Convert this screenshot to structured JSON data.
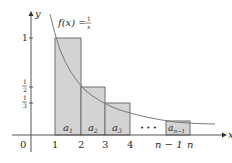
{
  "figure": {
    "function_label": "f(x) =",
    "function_numerator": "1",
    "function_denominator": "x",
    "axes": {
      "x_label": "x",
      "y_label": "y",
      "origin_label": "0"
    },
    "x_ticks": [
      "1",
      "2",
      "3",
      "4",
      "n − 1",
      "n"
    ],
    "y_ticks": [
      {
        "num": "1",
        "den": ""
      },
      {
        "num": "1",
        "den": "2"
      },
      {
        "num": "1",
        "den": "3"
      }
    ],
    "rectangles": [
      {
        "label": "a",
        "sub": "1",
        "x0": 1,
        "x1": 2,
        "height": 1
      },
      {
        "label": "a",
        "sub": "2",
        "x0": 2,
        "x1": 3,
        "height": 0.5
      },
      {
        "label": "a",
        "sub": "3",
        "x0": 3,
        "x1": 4,
        "height": 0.3333
      },
      {
        "label": "a",
        "sub": "n−1",
        "x0": "n−1",
        "x1": "n",
        "height": "1/(n−1)"
      }
    ],
    "ellipsis": "• • •",
    "colors": {
      "rect_fill": "#d3d3d3",
      "rect_stroke": "#6e6e6e",
      "axis": "#555555",
      "curve": "#7a7a7a"
    }
  }
}
